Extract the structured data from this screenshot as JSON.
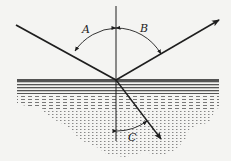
{
  "diagram": {
    "type": "reflection-refraction",
    "background_color": "#f4f4f2",
    "ink_color": "#1e1e1e",
    "interface": {
      "y": 80,
      "x_start": 17,
      "x_end": 219,
      "description": "water surface"
    },
    "point_of_incidence": {
      "x": 116,
      "y": 80
    },
    "normal": {
      "x": 116,
      "y_top": 6,
      "y_bottom": 141
    },
    "incident_ray": {
      "from": [
        16,
        25
      ],
      "to": [
        116,
        80
      ]
    },
    "reflected_ray": {
      "from": [
        116,
        80
      ],
      "to": [
        219,
        20
      ],
      "arrow": true
    },
    "refracted_ray": {
      "from": [
        116,
        80
      ],
      "to": [
        161,
        139
      ],
      "arrow": true
    },
    "angles": [
      {
        "id": "A",
        "label": "A",
        "between": [
          "incident_ray",
          "normal"
        ],
        "label_pos": [
          86,
          33
        ]
      },
      {
        "id": "B",
        "label": "B",
        "between": [
          "normal",
          "reflected_ray"
        ],
        "label_pos": [
          142,
          32
        ]
      },
      {
        "id": "C",
        "label": "C",
        "between": [
          "normal",
          "refracted_ray"
        ],
        "label_pos": [
          131,
          140
        ]
      }
    ]
  }
}
